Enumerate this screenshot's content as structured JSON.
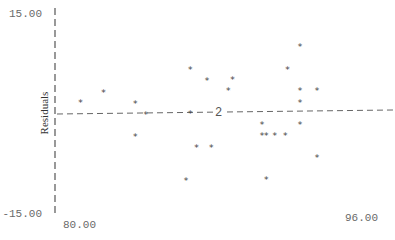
{
  "chart_data": {
    "type": "scatter",
    "title": "",
    "xlabel": "",
    "ylabel": "Residuals",
    "xlim": [
      80.0,
      96.0
    ],
    "ylim": [
      -15.0,
      15.0
    ],
    "x_ticks": [
      "80.00",
      "96.00"
    ],
    "y_ticks": [
      "15.00",
      "-15.00"
    ],
    "marker": "*",
    "grid": false,
    "legend": null,
    "reference_line": {
      "style": "dashed",
      "y_start": 0.0,
      "y_end": 0.5,
      "label": "2"
    },
    "points": [
      {
        "x": 81.2,
        "y": 1.8
      },
      {
        "x": 82.3,
        "y": 3.3
      },
      {
        "x": 83.8,
        "y": 1.7
      },
      {
        "x": 83.8,
        "y": -3.3
      },
      {
        "x": 84.3,
        "y": 0.0
      },
      {
        "x": 86.4,
        "y": 6.8
      },
      {
        "x": 86.4,
        "y": 0.2
      },
      {
        "x": 87.2,
        "y": 5.1
      },
      {
        "x": 86.7,
        "y": -5.0
      },
      {
        "x": 87.4,
        "y": -5.0
      },
      {
        "x": 86.2,
        "y": -9.9
      },
      {
        "x": 88.2,
        "y": 3.6
      },
      {
        "x": 88.4,
        "y": 5.3
      },
      {
        "x": 89.8,
        "y": -1.5
      },
      {
        "x": 89.8,
        "y": -3.2
      },
      {
        "x": 90.0,
        "y": -3.2
      },
      {
        "x": 90.4,
        "y": -3.2
      },
      {
        "x": 90.9,
        "y": -3.2
      },
      {
        "x": 90.0,
        "y": -9.8
      },
      {
        "x": 91.0,
        "y": 6.8
      },
      {
        "x": 91.6,
        "y": 10.2
      },
      {
        "x": 91.6,
        "y": 3.6
      },
      {
        "x": 91.6,
        "y": 1.8
      },
      {
        "x": 91.6,
        "y": -1.5
      },
      {
        "x": 92.4,
        "y": 3.6
      },
      {
        "x": 92.4,
        "y": -6.5
      }
    ]
  },
  "labels": {
    "ytop": "15.00",
    "ybottom": "-15.00",
    "xleft": "80.00",
    "xright": "96.00",
    "ylabel": "Residuals",
    "line_label": "2",
    "marker": "*"
  }
}
